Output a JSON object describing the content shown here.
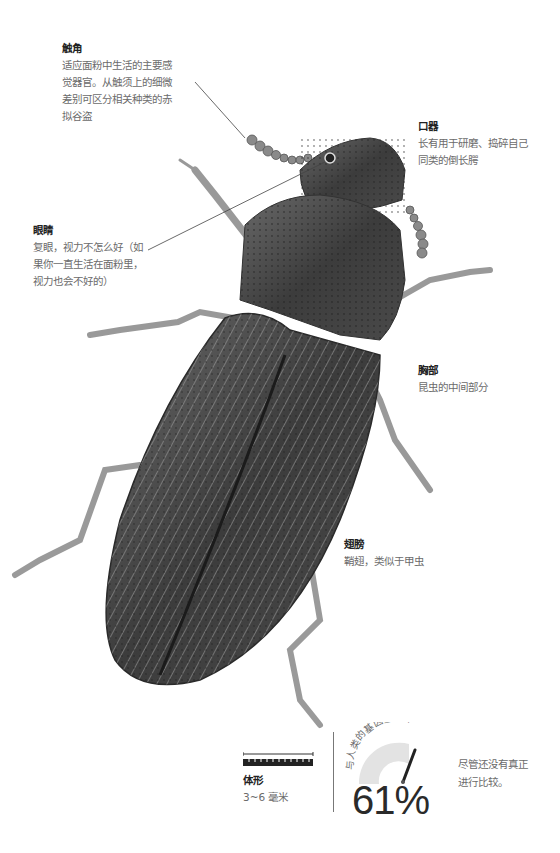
{
  "annotations": {
    "antenna": {
      "title": "触角",
      "desc_lines": [
        "适应面粉中生活的主要感",
        "觉器官。从触须上的细微",
        "差别可区分相关种类的赤",
        "拟谷盗"
      ]
    },
    "mouthparts": {
      "title": "口器",
      "desc_lines": [
        "长有用于研磨、捣碎自己",
        "同类的倒长腭"
      ]
    },
    "eyes": {
      "title": "眼睛",
      "desc_lines": [
        "复眼，视力不怎么好（如",
        "果你一直生活在面粉里，",
        "视力也会不好的）"
      ]
    },
    "thorax": {
      "title": "胸部",
      "desc_lines": [
        "昆虫的中间部分"
      ]
    },
    "wings": {
      "title": "翅膀",
      "desc_lines": [
        "鞘翅，类似于甲虫"
      ]
    }
  },
  "footer": {
    "size": {
      "title": "体形",
      "value": "3~6 毫米"
    },
    "gene": {
      "arc_label": "与人类的基因重合率",
      "percent": "61%",
      "value": 61,
      "note_lines": [
        "尽管还没有真正",
        "进行比较。"
      ]
    }
  },
  "colors": {
    "gauge_track": "#e3e3e3",
    "gauge_needle": "#222222",
    "text_muted": "#6b6b6b"
  }
}
